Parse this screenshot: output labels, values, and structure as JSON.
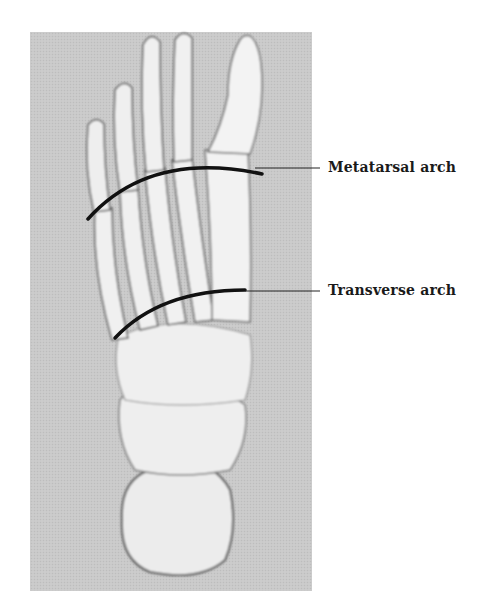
{
  "figure": {
    "labels": {
      "metatarsal": "Metatarsal arch",
      "transverse": "Transverse arch"
    }
  },
  "colors": {
    "photo_background": "#c9c9c9",
    "bone": "#ececec",
    "arch_line": "#111111",
    "label_text": "#1a1a1a"
  }
}
